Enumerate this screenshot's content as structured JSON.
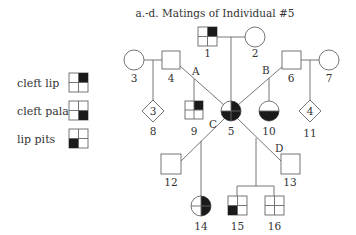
{
  "title": "a.-d. Matings of Individual #5",
  "legend": [
    {
      "label": "cleft lip",
      "filled_quadrant": "top-right"
    },
    {
      "label": "cleft palate",
      "filled_quadrant": "bottom-right"
    },
    {
      "label": "lip pits",
      "filled_quadrant": "bottom-left"
    }
  ],
  "mating_labels": {
    "a": "A",
    "b": "B",
    "c": "C",
    "d": "D"
  },
  "individuals": [
    {
      "id": "1",
      "sex": "male",
      "affected": [
        "top-right"
      ]
    },
    {
      "id": "2",
      "sex": "female",
      "affected": []
    },
    {
      "id": "3",
      "sex": "female",
      "affected": []
    },
    {
      "id": "4",
      "sex": "male",
      "affected": []
    },
    {
      "id": "5",
      "sex": "female",
      "affected": [
        "top-right",
        "bottom-right",
        "bottom-left"
      ]
    },
    {
      "id": "6",
      "sex": "male",
      "affected": []
    },
    {
      "id": "7",
      "sex": "female",
      "affected": []
    },
    {
      "id": "8",
      "sex": "unknown",
      "count": "3",
      "affected": []
    },
    {
      "id": "9",
      "sex": "male",
      "affected": [
        "top-right"
      ]
    },
    {
      "id": "10",
      "sex": "female",
      "affected": [
        "bottom-right",
        "bottom-left"
      ]
    },
    {
      "id": "11",
      "sex": "unknown",
      "count": "4",
      "affected": []
    },
    {
      "id": "12",
      "sex": "male",
      "affected": []
    },
    {
      "id": "13",
      "sex": "male",
      "affected": []
    },
    {
      "id": "14",
      "sex": "female",
      "affected": [
        "top-right",
        "bottom-right"
      ]
    },
    {
      "id": "15",
      "sex": "male",
      "affected": [
        "bottom-left"
      ]
    },
    {
      "id": "16",
      "sex": "male",
      "affected": []
    }
  ]
}
